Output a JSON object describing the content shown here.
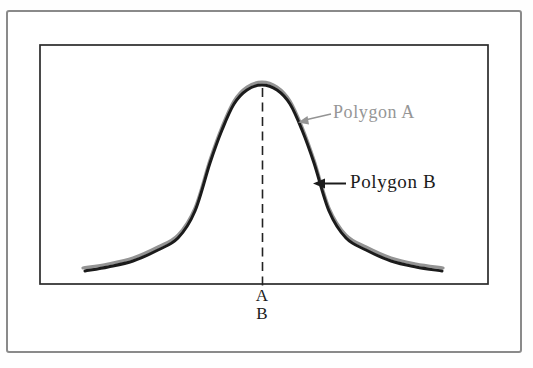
{
  "figure": {
    "caption_note": "Two superimposed frequency polygons with the same central tendency",
    "labels": {
      "polygon_a": "Polygon A",
      "polygon_b": "Polygon B",
      "center_a": "A",
      "center_b": "B"
    },
    "colors": {
      "polygon_a": "#949494",
      "polygon_b": "#1b1b1b",
      "outer_border": "#8a8a8a",
      "plot_frame": "#2b2b2b",
      "dashed_line": "#222222"
    }
  },
  "chart_data": {
    "type": "line",
    "title": "",
    "xlabel": "",
    "ylabel": "",
    "axes_labeled": false,
    "grid": false,
    "legend_position": "inline-annotations",
    "annotations": [
      "Polygon A",
      "Polygon B"
    ],
    "center_line": {
      "x_px": 262.5,
      "y_top_px": 88,
      "y_bottom_px": 288,
      "tick_labels": [
        "A",
        "B"
      ]
    },
    "series": [
      {
        "name": "Polygon A",
        "color": "#949494",
        "stroke_width": 3.2,
        "points_px": [
          [
            83,
            268
          ],
          [
            108,
            264
          ],
          [
            133,
            258
          ],
          [
            158,
            247
          ],
          [
            178,
            235
          ],
          [
            195,
            208
          ],
          [
            210,
            160
          ],
          [
            222,
            127
          ],
          [
            234,
            101
          ],
          [
            247,
            87
          ],
          [
            262,
            82
          ],
          [
            277,
            87
          ],
          [
            290,
            101
          ],
          [
            302,
            127
          ],
          [
            314,
            160
          ],
          [
            329,
            208
          ],
          [
            346,
            235
          ],
          [
            366,
            247
          ],
          [
            391,
            258
          ],
          [
            416,
            264
          ],
          [
            443,
            268
          ]
        ]
      },
      {
        "name": "Polygon B",
        "color": "#1b1b1b",
        "stroke_width": 3.0,
        "points_px": [
          [
            85,
            271
          ],
          [
            108,
            267
          ],
          [
            133,
            261
          ],
          [
            158,
            250
          ],
          [
            178,
            238
          ],
          [
            195,
            211
          ],
          [
            210,
            163
          ],
          [
            222,
            130
          ],
          [
            234,
            104
          ],
          [
            247,
            90
          ],
          [
            262,
            85
          ],
          [
            277,
            90
          ],
          [
            290,
            104
          ],
          [
            302,
            130
          ],
          [
            314,
            163
          ],
          [
            329,
            211
          ],
          [
            346,
            238
          ],
          [
            366,
            250
          ],
          [
            391,
            261
          ],
          [
            416,
            267
          ],
          [
            442,
            271
          ]
        ]
      }
    ]
  }
}
